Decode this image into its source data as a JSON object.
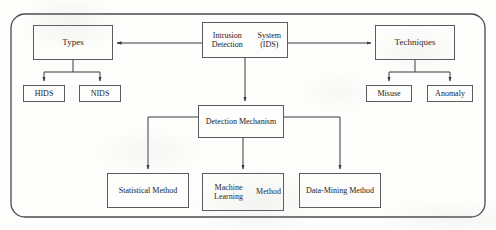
{
  "diagram": {
    "type": "flowchart",
    "frame": {
      "shape": "rounded-rectangle",
      "label": "outer-frame"
    },
    "nodes": [
      {
        "id": "root",
        "label": "Intrusion Detection\nSystem (IDS)",
        "line1": "Intrusion Detection",
        "line2": "System (IDS)"
      },
      {
        "id": "types",
        "label": "Types"
      },
      {
        "id": "techniques",
        "label": "Techniques"
      },
      {
        "id": "hids",
        "label": "HIDS"
      },
      {
        "id": "nids",
        "label": "NIDS"
      },
      {
        "id": "misuse",
        "label": "Misuse"
      },
      {
        "id": "anomaly",
        "label": "Anomaly"
      },
      {
        "id": "detection_mechanism",
        "label": "Detection Mechanism"
      },
      {
        "id": "statistical",
        "label": "Statistical Method"
      },
      {
        "id": "machine_learning",
        "label": "Machine Learning\nMethod",
        "line1": "Machine Learning",
        "line2": "Method"
      },
      {
        "id": "data_mining",
        "label": "Data-Mining Method"
      }
    ],
    "edges": [
      {
        "from": "root",
        "to": "types",
        "arrow": "end"
      },
      {
        "from": "root",
        "to": "techniques",
        "arrow": "end"
      },
      {
        "from": "root",
        "to": "detection_mechanism",
        "arrow": "end"
      },
      {
        "from": "types",
        "to": "hids",
        "arrow": "end"
      },
      {
        "from": "types",
        "to": "nids",
        "arrow": "end"
      },
      {
        "from": "techniques",
        "to": "misuse",
        "arrow": "end"
      },
      {
        "from": "techniques",
        "to": "anomaly",
        "arrow": "end"
      },
      {
        "from": "detection_mechanism",
        "to": "statistical",
        "arrow": "end"
      },
      {
        "from": "detection_mechanism",
        "to": "machine_learning",
        "arrow": "end"
      },
      {
        "from": "detection_mechanism",
        "to": "data_mining",
        "arrow": "end"
      }
    ],
    "colors": {
      "background": "#fdfdfc",
      "box_border": "#5b5b5b",
      "frame_border": "#4a4a4a",
      "connector": "#3a3a3a",
      "text": "#1a1a1a"
    }
  }
}
